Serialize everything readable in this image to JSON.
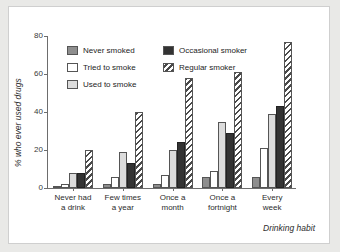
{
  "chart_data": {
    "type": "bar",
    "title": "",
    "xlabel": "Drinking habit",
    "ylabel": "% who ever used drugs",
    "ylim": [
      0,
      80
    ],
    "yticks": [
      0,
      20,
      40,
      60,
      80
    ],
    "grid": false,
    "legend_position": "top-left-inside",
    "categories": [
      "Never had\na drink",
      "Few times\na year",
      "Once a\nmonth",
      "Once a\nfortnight",
      "Every\nweek"
    ],
    "series": [
      {
        "name": "Never smoked",
        "color": "#8e8e8e",
        "pattern": "solid",
        "values": [
          1,
          2,
          2,
          6,
          6
        ]
      },
      {
        "name": "Tried to smoke",
        "color": "#ffffff",
        "pattern": "solid",
        "values": [
          2,
          6,
          7,
          9,
          21
        ]
      },
      {
        "name": "Used to smoke",
        "color": "#dcdcdc",
        "pattern": "solid",
        "values": [
          8,
          19,
          20,
          35,
          39
        ]
      },
      {
        "name": "Occasional smoker",
        "color": "#333333",
        "pattern": "solid",
        "values": [
          8,
          13,
          24,
          29,
          43
        ]
      },
      {
        "name": "Regular smoker",
        "color": "#4a4a4a",
        "pattern": "hatch",
        "values": [
          20,
          40,
          58,
          61,
          77
        ]
      }
    ]
  },
  "legend": {
    "entries": [
      {
        "label": "Never smoked"
      },
      {
        "label": "Occasional smoker"
      },
      {
        "label": "Tried to smoke"
      },
      {
        "label": "Regular smoker"
      },
      {
        "label": "Used to smoke"
      }
    ]
  },
  "axis": {
    "y_title": "% who ever used drugs",
    "x_title": "Drinking habit",
    "y_tick_labels": [
      "0",
      "20",
      "40",
      "60",
      "80"
    ]
  }
}
